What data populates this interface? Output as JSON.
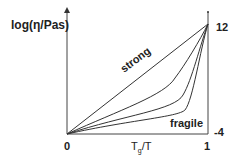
{
  "diagram": {
    "y_axis_label": "log(η/Pas)",
    "x_axis_label_main": "T",
    "x_axis_label_sub": "g",
    "x_axis_label_tail": "/T",
    "x_tick_left": "0",
    "x_tick_right": "1",
    "y_tick_top": "12",
    "y_tick_bottom": "-4",
    "curve_label_strong": "strong",
    "curve_label_fragile": "fragile",
    "line_color": "#333333"
  }
}
